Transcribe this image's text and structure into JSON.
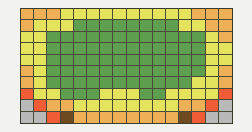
{
  "figure": {
    "name": "pixel-grid-mosaic",
    "background_color": "#f2f2f0",
    "grid_line_color": "#4a4a38"
  },
  "chart_data": {
    "type": "heatmap",
    "title": "",
    "xlabel": "",
    "ylabel": "",
    "rows": 9,
    "cols": 16,
    "legend": [
      {
        "key": "G",
        "label": "green",
        "color": "#5d9e4f"
      },
      {
        "key": "Y",
        "label": "yellow",
        "color": "#e3e35c"
      },
      {
        "key": "O",
        "label": "orange",
        "color": "#edb057"
      },
      {
        "key": "R",
        "label": "red",
        "color": "#ef5c36"
      },
      {
        "key": "A",
        "label": "gray",
        "color": "#b9b9b9"
      },
      {
        "key": "B",
        "label": "brown",
        "color": "#6e4a20"
      }
    ],
    "cells": [
      [
        "O",
        "O",
        "O",
        "Y",
        "Y",
        "Y",
        "Y",
        "Y",
        "Y",
        "Y",
        "Y",
        "Y",
        "Y",
        "O",
        "O",
        "O"
      ],
      [
        "O",
        "Y",
        "Y",
        "Y",
        "G",
        "G",
        "G",
        "G",
        "G",
        "G",
        "G",
        "G",
        "Y",
        "Y",
        "O",
        "O"
      ],
      [
        "Y",
        "Y",
        "G",
        "G",
        "G",
        "G",
        "G",
        "G",
        "G",
        "G",
        "G",
        "G",
        "G",
        "G",
        "Y",
        "O"
      ],
      [
        "Y",
        "Y",
        "G",
        "G",
        "G",
        "G",
        "G",
        "G",
        "G",
        "G",
        "G",
        "G",
        "G",
        "G",
        "Y",
        "Y"
      ],
      [
        "Y",
        "Y",
        "G",
        "G",
        "G",
        "G",
        "G",
        "G",
        "G",
        "G",
        "G",
        "G",
        "G",
        "G",
        "Y",
        "Y"
      ],
      [
        "O",
        "Y",
        "G",
        "G",
        "G",
        "G",
        "G",
        "G",
        "G",
        "G",
        "G",
        "G",
        "G",
        "G",
        "Y",
        "O"
      ],
      [
        "O",
        "Y",
        "G",
        "G",
        "G",
        "G",
        "G",
        "G",
        "G",
        "G",
        "G",
        "G",
        "G",
        "Y",
        "Y",
        "O"
      ],
      [
        "R",
        "Y",
        "Y",
        "G",
        "G",
        "G",
        "Y",
        "Y",
        "Y",
        "G",
        "G",
        "Y",
        "Y",
        "Y",
        "Y",
        "R"
      ],
      [
        "A",
        "R",
        "O",
        "O",
        "Y",
        "Y",
        "Y",
        "Y",
        "Y",
        "Y",
        "Y",
        "Y",
        "O",
        "O",
        "R",
        "A"
      ],
      [
        "A",
        "A",
        "R",
        "B",
        "O",
        "O",
        "O",
        "O",
        "O",
        "O",
        "O",
        "O",
        "B",
        "R",
        "A",
        "A"
      ]
    ]
  }
}
